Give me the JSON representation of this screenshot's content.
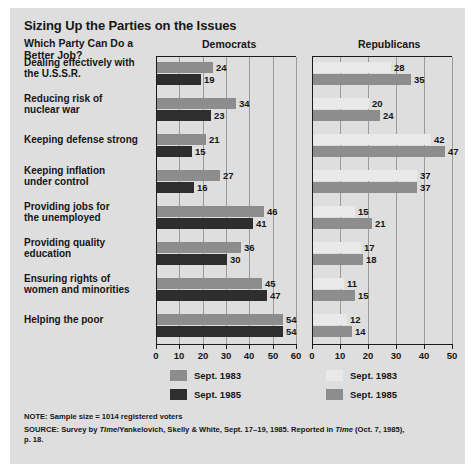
{
  "title": "Sizing Up the Parties on the Issues",
  "subtitle_line1": "Which Party Can Do a",
  "subtitle_line2": "Better Job?",
  "panels": {
    "democrats": "Democrats",
    "republicans": "Republicans"
  },
  "legend": {
    "dem_1983": "Sept. 1983",
    "dem_1985": "Sept. 1985",
    "rep_1983": "Sept. 1983",
    "rep_1985": "Sept. 1985"
  },
  "notes": {
    "note": "NOTE: Sample size = 1014 registered voters",
    "source_a": "SOURCE: Survey by ",
    "source_time1": "Time",
    "source_b": "/Yankelovich, Skelly & White, Sept. 17–19, 1985. Reported in ",
    "source_time2": "Time",
    "source_c": " (Oct. 7, 1985),",
    "source_d": "p. 18."
  },
  "colors": {
    "panel_bg": "#dedede",
    "dem_1983": "#8d8d8d",
    "dem_1985": "#2e2e2e",
    "rep_1983": "#e9e9e9",
    "rep_1985": "#8d8d8d",
    "axis": "#1a1a1a",
    "grid": "#9a9a9a"
  },
  "chart_data": {
    "type": "bar",
    "orientation": "horizontal",
    "title": "Sizing Up the Parties on the Issues",
    "subtitle": "Which Party Can Do a Better Job?",
    "grid": true,
    "legend_position": "bottom",
    "categories": [
      "Dealing effectively with the U.S.S.R.",
      "Reducing risk of nuclear war",
      "Keeping defense strong",
      "Keeping inflation under control",
      "Providing jobs for the unemployed",
      "Providing quality education",
      "Ensuring rights of women and minorities",
      "Helping the poor"
    ],
    "category_lines": [
      [
        "Dealing effectively with",
        "the U.S.S.R."
      ],
      [
        "Reducing risk of",
        "nuclear war"
      ],
      [
        "Keeping defense strong"
      ],
      [
        "Keeping inflation",
        "under control"
      ],
      [
        "Providing jobs for",
        "the unemployed"
      ],
      [
        "Providing quality",
        "education"
      ],
      [
        "Ensuring rights of",
        "women and minorities"
      ],
      [
        "Helping the poor"
      ]
    ],
    "panels": [
      {
        "name": "Democrats",
        "xlim": [
          0,
          60
        ],
        "xticks": [
          0,
          10,
          20,
          30,
          40,
          50,
          60
        ],
        "series": [
          {
            "name": "Sept. 1983",
            "values": [
              24,
              34,
              21,
              27,
              46,
              36,
              45,
              54
            ]
          },
          {
            "name": "Sept. 1985",
            "values": [
              19,
              23,
              15,
              16,
              41,
              30,
              47,
              54
            ]
          }
        ]
      },
      {
        "name": "Republicans",
        "xlim": [
          0,
          50
        ],
        "xticks": [
          0,
          10,
          20,
          30,
          40,
          50
        ],
        "series": [
          {
            "name": "Sept. 1983",
            "values": [
              28,
              20,
              42,
              37,
              15,
              17,
              11,
              12
            ]
          },
          {
            "name": "Sept. 1985",
            "values": [
              35,
              24,
              47,
              37,
              21,
              18,
              15,
              14
            ]
          }
        ]
      }
    ],
    "xlabel": "",
    "ylabel": ""
  }
}
